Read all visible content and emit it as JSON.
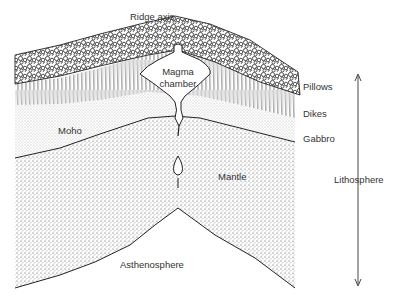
{
  "diagram": {
    "labels": {
      "ridge_axis": "Ridge axis",
      "magma_chamber_line1": "Magma",
      "magma_chamber_line2": "chamber",
      "pillows": "Pillows",
      "dikes": "Dikes",
      "gabbro": "Gabbro",
      "moho": "Moho",
      "mantle": "Mantle",
      "lithosphere": "Lithosphere",
      "asthenosphere": "Asthenosphere"
    },
    "layers": [
      "Pillows",
      "Dikes",
      "Gabbro",
      "Mantle",
      "Asthenosphere"
    ],
    "colors": {
      "ink": "#222222",
      "background": "#ffffff",
      "stipple": "#555555"
    }
  }
}
